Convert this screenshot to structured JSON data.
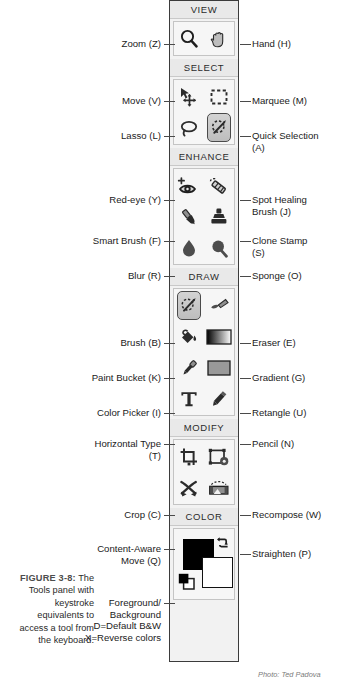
{
  "figure": {
    "number": "FIGURE 3-8:",
    "caption": "The Tools panel with keystroke equivalents to access a tool from the keyboard.",
    "photo_credit": "Photo: Ted Padova"
  },
  "panel": {
    "title": "Tools panel",
    "groups": [
      {
        "header": "VIEW",
        "tools": [
          {
            "icon": "magnifier-icon",
            "label": "Zoom (Z)",
            "side": "left",
            "selected": false
          },
          {
            "icon": "hand-icon",
            "label": "Hand (H)",
            "side": "right",
            "selected": false
          }
        ]
      },
      {
        "header": "SELECT",
        "tools": [
          {
            "icon": "move-icon",
            "label": "Move (V)",
            "side": "left",
            "selected": false
          },
          {
            "icon": "marquee-icon",
            "label": "Marquee (M)",
            "side": "right",
            "selected": false
          },
          {
            "icon": "lasso-icon",
            "label": "Lasso (L)",
            "side": "left",
            "selected": false
          },
          {
            "icon": "quick-selection-icon",
            "label": "Quick Selection (A)",
            "side": "right",
            "selected": true
          }
        ]
      },
      {
        "header": "ENHANCE",
        "tools": [
          {
            "icon": "red-eye-icon",
            "label": "Red-eye (Y)",
            "side": "left",
            "selected": false
          },
          {
            "icon": "spot-healing-brush-icon",
            "label": "Spot Healing Brush (J)",
            "side": "right",
            "selected": false
          },
          {
            "icon": "smart-brush-icon",
            "label": "Smart Brush (F)",
            "side": "left",
            "selected": false
          },
          {
            "icon": "clone-stamp-icon",
            "label": "Clone Stamp (S)",
            "side": "right",
            "selected": false
          },
          {
            "icon": "blur-droplet-icon",
            "label": "Blur (R)",
            "side": "left",
            "selected": false
          },
          {
            "icon": "sponge-icon",
            "label": "Sponge (O)",
            "side": "right",
            "selected": false
          }
        ]
      },
      {
        "header": "DRAW",
        "tools": [
          {
            "icon": "brush-icon",
            "label": "Brush (B)",
            "side": "left",
            "selected": true
          },
          {
            "icon": "eraser-icon",
            "label": "Eraser (E)",
            "side": "right",
            "selected": false
          },
          {
            "icon": "paint-bucket-icon",
            "label": "Paint Bucket (K)",
            "side": "left",
            "selected": false
          },
          {
            "icon": "gradient-icon",
            "label": "Gradient (G)",
            "side": "right",
            "selected": false
          },
          {
            "icon": "eyedropper-icon",
            "label": "Color Picker (I)",
            "side": "left",
            "selected": false
          },
          {
            "icon": "rectangle-icon",
            "label": "Retangle (U)",
            "side": "right",
            "selected": false
          },
          {
            "icon": "type-icon",
            "label": "Horizontal Type\n(T)",
            "side": "left",
            "selected": false
          },
          {
            "icon": "pencil-icon",
            "label": "Pencil (N)",
            "side": "right",
            "selected": false
          }
        ]
      },
      {
        "header": "MODIFY",
        "tools": [
          {
            "icon": "crop-icon",
            "label": "Crop (C)",
            "side": "left",
            "selected": false
          },
          {
            "icon": "recompose-icon",
            "label": "Recompose (W)",
            "side": "right",
            "selected": false
          },
          {
            "icon": "content-aware-move-icon",
            "label": "Content-Aware\nMove (Q)",
            "side": "left",
            "selected": false
          },
          {
            "icon": "straighten-icon",
            "label": "Straighten (P)",
            "side": "right",
            "selected": false
          }
        ]
      },
      {
        "header": "COLOR",
        "tools": [
          {
            "icon": "color-swatches-icon",
            "label": "Foreground/\nBackground\nD=Default B&W\nX=Reverse colors",
            "side": "left",
            "selected": false
          }
        ]
      }
    ],
    "colors": {
      "foreground": "#000000",
      "background": "#ffffff",
      "swap_icon": "swap-colors-icon",
      "default_icon": "default-colors-icon"
    }
  },
  "labels": {
    "zoom": "Zoom (Z)",
    "hand": "Hand (H)",
    "move": "Move (V)",
    "marquee": "Marquee (M)",
    "lasso": "Lasso (L)",
    "quick_selection": "Quick Selection\n(A)",
    "red_eye": "Red-eye (Y)",
    "spot_healing": "Spot Healing\nBrush (J)",
    "smart_brush": "Smart Brush (F)",
    "clone_stamp": "Clone Stamp\n(S)",
    "blur": "Blur (R)",
    "sponge": "Sponge (O)",
    "brush": "Brush (B)",
    "eraser": "Eraser (E)",
    "paint_bucket": "Paint Bucket (K)",
    "gradient": "Gradient (G)",
    "color_picker": "Color Picker (I)",
    "rectangle": "Retangle (U)",
    "horizontal_type": "Horizontal Type\n(T)",
    "pencil": "Pencil (N)",
    "crop": "Crop (C)",
    "recompose": "Recompose (W)",
    "content_aware_move": "Content-Aware\nMove (Q)",
    "straighten": "Straighten (P)",
    "color_note": "Foreground/\nBackground\nD=Default B&W\nX=Reverse colors"
  },
  "group_headers": {
    "view": "VIEW",
    "select": "SELECT",
    "enhance": "ENHANCE",
    "draw": "DRAW",
    "modify": "MODIFY",
    "color": "COLOR"
  }
}
